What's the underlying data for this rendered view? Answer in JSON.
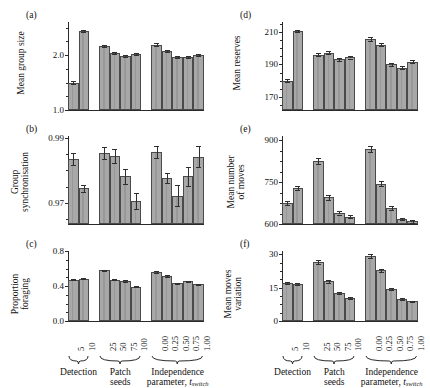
{
  "figure": {
    "width": 430,
    "height": 384,
    "bar_fill": "#a8a8a8",
    "bar_stroke": "#4a4a4a",
    "axis_color": "#2a2a2a"
  },
  "groups": [
    {
      "name": "Detection",
      "name_line2": "",
      "categories": [
        "5",
        "10"
      ]
    },
    {
      "name": "Patch",
      "name_line2": "seeds",
      "categories": [
        "25",
        "50",
        "75",
        "100"
      ]
    },
    {
      "name": "Independence",
      "name_line2": "parameter, t_switch",
      "categories": [
        "0.00",
        "0.25",
        "0.50",
        "0.75",
        "1.00"
      ]
    }
  ],
  "xaxis": {
    "group_labels": [
      "Detection",
      "Patch seeds",
      "Independence parameter, t_switch"
    ],
    "independence_label_part1": "Independence",
    "independence_label_part2": "parameter, ",
    "independence_label_italic": "t",
    "independence_label_sub": "switch",
    "patch_label_part1": "Patch",
    "patch_label_part2": "seeds",
    "detection_label": "Detection"
  },
  "chart_data": [
    {
      "type": "bar",
      "panel": "a",
      "title": "",
      "ylabel": "Mean group size",
      "xlabel": "",
      "ylim": [
        1.0,
        2.6
      ],
      "yticks": [
        1.0,
        2.0
      ],
      "yticklabels": [
        "1.0",
        "2.0"
      ],
      "grid": false,
      "categories": [
        "5",
        "10",
        "25",
        "50",
        "75",
        "100",
        "0.00",
        "0.25",
        "0.50",
        "0.75",
        "1.00"
      ],
      "values": [
        1.5,
        2.44,
        2.16,
        2.03,
        1.98,
        2.02,
        2.19,
        2.07,
        1.97,
        1.96,
        2.0
      ],
      "errors": [
        0.02,
        0.02,
        0.02,
        0.02,
        0.02,
        0.02,
        0.02,
        0.02,
        0.02,
        0.02,
        0.02
      ]
    },
    {
      "type": "bar",
      "panel": "b",
      "title": "",
      "ylabel": "Group synchronisation",
      "xlabel": "",
      "ylim": [
        0.9635,
        0.9905
      ],
      "yticks": [
        0.97,
        0.99
      ],
      "yticklabels": [
        "0.97",
        "0.99"
      ],
      "grid": false,
      "categories": [
        "5",
        "10",
        "25",
        "50",
        "75",
        "100",
        "0.00",
        "0.25",
        "0.50",
        "0.75",
        "1.00"
      ],
      "values": [
        0.9835,
        0.9745,
        0.9853,
        0.9843,
        0.9782,
        0.9705,
        0.9856,
        0.9777,
        0.9722,
        0.9781,
        0.9842
      ],
      "errors": [
        0.0019,
        0.0011,
        0.0018,
        0.0022,
        0.0023,
        0.0025,
        0.0018,
        0.0016,
        0.0033,
        0.003,
        0.0031
      ]
    },
    {
      "type": "bar",
      "panel": "c",
      "title": "",
      "ylabel": "Proportion foraging",
      "xlabel": "",
      "ylim": [
        0.0,
        0.8
      ],
      "yticks": [
        0.0,
        0.4,
        0.8
      ],
      "yticklabels": [
        "0.0",
        "0.4",
        "0.8"
      ],
      "grid": false,
      "categories": [
        "5",
        "10",
        "25",
        "50",
        "75",
        "100",
        "0.00",
        "0.25",
        "0.50",
        "0.75",
        "1.00"
      ],
      "values": [
        0.47,
        0.482,
        0.578,
        0.472,
        0.458,
        0.392,
        0.563,
        0.512,
        0.43,
        0.452,
        0.418
      ],
      "errors": [
        0.007,
        0.007,
        0.01,
        0.008,
        0.008,
        0.008,
        0.01,
        0.009,
        0.008,
        0.008,
        0.008
      ]
    },
    {
      "type": "bar",
      "panel": "d",
      "title": "",
      "ylabel": "Mean reserves",
      "xlabel": "",
      "ylim": [
        162,
        216
      ],
      "yticks": [
        170,
        190,
        210
      ],
      "yticklabels": [
        "170",
        "190",
        "210"
      ],
      "grid": false,
      "categories": [
        "5",
        "10",
        "25",
        "50",
        "75",
        "100",
        "0.00",
        "0.25",
        "0.50",
        "0.75",
        "1.00"
      ],
      "values": [
        180.0,
        210.5,
        196.0,
        197.0,
        193.0,
        194.5,
        205.5,
        202.0,
        190.0,
        188.0,
        191.5
      ],
      "errors": [
        0.8,
        0.8,
        0.8,
        0.9,
        0.9,
        0.9,
        1.0,
        1.0,
        0.9,
        0.9,
        0.9
      ]
    },
    {
      "type": "bar",
      "panel": "e",
      "title": "",
      "ylabel": "Mean number of moves",
      "xlabel": "",
      "ylim": [
        600,
        915
      ],
      "yticks": [
        600,
        750,
        900
      ],
      "yticklabels": [
        "600",
        "750",
        "900"
      ],
      "grid": false,
      "categories": [
        "5",
        "10",
        "25",
        "50",
        "75",
        "100",
        "0.00",
        "0.25",
        "0.50",
        "0.75",
        "1.00"
      ],
      "values": [
        676,
        729,
        826,
        695,
        641,
        626,
        868,
        744,
        658,
        618,
        610
      ],
      "errors": [
        7,
        8,
        10,
        8,
        7,
        6,
        11,
        9,
        7,
        5,
        5
      ]
    },
    {
      "type": "bar",
      "panel": "f",
      "title": "",
      "ylabel": "Mean moves variation",
      "xlabel": "",
      "ylim": [
        0,
        31.5
      ],
      "yticks": [
        0,
        15,
        30
      ],
      "yticklabels": [
        "0",
        "15",
        "30"
      ],
      "grid": false,
      "categories": [
        "5",
        "10",
        "25",
        "50",
        "75",
        "100",
        "0.00",
        "0.25",
        "0.50",
        "0.75",
        "1.00"
      ],
      "values": [
        17.1,
        16.6,
        26.6,
        17.9,
        12.6,
        10.3,
        29.3,
        22.8,
        14.4,
        9.9,
        8.8
      ],
      "errors": [
        0.6,
        0.6,
        0.9,
        0.7,
        0.5,
        0.4,
        0.9,
        0.8,
        0.5,
        0.4,
        0.4
      ]
    }
  ],
  "panels": {
    "a": {
      "letter": "(a)",
      "ylabel": "Mean group size"
    },
    "b": {
      "letter": "(b)",
      "ylabel_line1": "Group",
      "ylabel_line2": "synchronisation"
    },
    "c": {
      "letter": "(c)",
      "ylabel_line1": "Proportion",
      "ylabel_line2": "foraging"
    },
    "d": {
      "letter": "(d)",
      "ylabel": "Mean reserves"
    },
    "e": {
      "letter": "(e)",
      "ylabel_line1": "Mean number",
      "ylabel_line2": "of moves"
    },
    "f": {
      "letter": "(f)",
      "ylabel_line1": "Mean moves",
      "ylabel_line2": "variation"
    }
  }
}
